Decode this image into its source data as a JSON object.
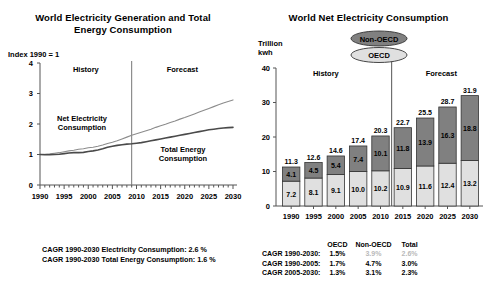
{
  "left": {
    "title_line1": "World Electricity Generation and Total",
    "title_line2": "Energy Consumption",
    "index_label": "Index 1990 = 1",
    "band_history": "History",
    "band_forecast": "Forecast",
    "series_1_line1": "Net Electricity",
    "series_1_line2": "Consumption",
    "series_2_line1": "Total Energy",
    "series_2_line2": "Consumption",
    "footnote_1": "CAGR 1990-2030 Electricity Consumption: 2.6 %",
    "footnote_2": "CAGR 1990-2030 Total Energy Consumption: 1.6 %"
  },
  "right": {
    "title": "World Net Electricity Consumption",
    "unit_line1": "Trillion",
    "unit_line2": "kwh",
    "band_history": "History",
    "band_forecast": "Forecast",
    "legend": [
      {
        "label": "Non-OECD",
        "color": "#808080"
      },
      {
        "label": "OECD",
        "color": "#e0e0e0"
      }
    ]
  },
  "cagr": {
    "col_headers": [
      "",
      "OECD",
      "Non-OECD",
      "Total"
    ],
    "rows": [
      {
        "label": "CAGR 1990-2030:",
        "oecd": "1.5%",
        "nonoecd": "3.9%",
        "total": "2.6%",
        "faded": true
      },
      {
        "label": "CAGR 1990-2005:",
        "oecd": "1.7%",
        "nonoecd": "4.7%",
        "total": "3.0%",
        "faded": false
      },
      {
        "label": "CAGR 2005-2030:",
        "oecd": "1.3%",
        "nonoecd": "3.1%",
        "total": "2.3%",
        "faded": false
      }
    ]
  },
  "chart_data": [
    {
      "type": "line",
      "title": "World Electricity Generation and Total Energy Consumption",
      "ylabel": "Index 1990 = 1",
      "xlabel": "",
      "ylim": [
        0,
        4
      ],
      "yticks": [
        0,
        1,
        2,
        3,
        4
      ],
      "xticks": [
        1990,
        1995,
        2000,
        2005,
        2010,
        2015,
        2020,
        2025,
        2030
      ],
      "xlim": [
        1990,
        2030
      ],
      "grid": false,
      "divider_x": 2009,
      "annotations": [
        "History",
        "Forecast"
      ],
      "x": [
        1990,
        1991,
        1992,
        1993,
        1994,
        1995,
        1996,
        1997,
        1998,
        1999,
        2000,
        2001,
        2002,
        2003,
        2004,
        2005,
        2006,
        2007,
        2008,
        2009,
        2010,
        2011,
        2012,
        2013,
        2014,
        2015,
        2016,
        2017,
        2018,
        2019,
        2020,
        2021,
        2022,
        2023,
        2024,
        2025,
        2026,
        2027,
        2028,
        2029,
        2030
      ],
      "series": [
        {
          "name": "Net Electricity Consumption",
          "color": "#8c8c8c",
          "values": [
            1.0,
            1.01,
            1.02,
            1.04,
            1.06,
            1.09,
            1.12,
            1.14,
            1.17,
            1.19,
            1.22,
            1.24,
            1.27,
            1.31,
            1.36,
            1.4,
            1.45,
            1.51,
            1.57,
            1.63,
            1.68,
            1.73,
            1.78,
            1.83,
            1.89,
            1.94,
            1.99,
            2.05,
            2.1,
            2.16,
            2.21,
            2.27,
            2.33,
            2.39,
            2.45,
            2.51,
            2.57,
            2.63,
            2.69,
            2.74,
            2.79
          ]
        },
        {
          "name": "Total Energy Consumption",
          "color": "#4a4a4a",
          "values": [
            1.0,
            0.99,
            0.99,
            1.0,
            1.01,
            1.03,
            1.05,
            1.06,
            1.06,
            1.07,
            1.1,
            1.12,
            1.15,
            1.19,
            1.24,
            1.27,
            1.3,
            1.32,
            1.34,
            1.35,
            1.37,
            1.39,
            1.42,
            1.45,
            1.48,
            1.51,
            1.54,
            1.57,
            1.6,
            1.63,
            1.66,
            1.69,
            1.72,
            1.75,
            1.78,
            1.81,
            1.83,
            1.85,
            1.87,
            1.88,
            1.89
          ]
        }
      ]
    },
    {
      "type": "bar",
      "subtype": "stacked",
      "title": "World Net Electricity Consumption",
      "ylabel": "Trillion kwh",
      "ylim": [
        0,
        40
      ],
      "yticks": [
        0,
        10,
        20,
        30,
        40
      ],
      "categories": [
        "1990",
        "1995",
        "2000",
        "2005",
        "2010",
        "2015",
        "2020",
        "2025",
        "2030"
      ],
      "divider_after_category": "2010",
      "annotations": [
        "History",
        "Forecast"
      ],
      "series": [
        {
          "name": "OECD",
          "color": "#e0e0e0",
          "values": [
            7.2,
            8.1,
            9.1,
            10.0,
            10.2,
            10.9,
            11.6,
            12.4,
            13.2
          ]
        },
        {
          "name": "Non-OECD",
          "color": "#808080",
          "values": [
            4.1,
            4.5,
            5.4,
            7.4,
            10.1,
            11.8,
            13.9,
            16.3,
            18.8
          ]
        }
      ],
      "totals": [
        11.3,
        12.6,
        14.6,
        17.4,
        20.3,
        22.7,
        25.5,
        28.7,
        31.9
      ]
    }
  ]
}
